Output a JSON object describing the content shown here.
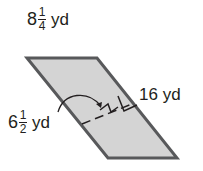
{
  "figure": {
    "shape": "parallelogram",
    "fill_color": "#d4d4d4",
    "stroke_color": "#58595b",
    "vertices": [
      [
        27,
        58
      ],
      [
        97,
        58
      ],
      [
        177,
        158
      ],
      [
        108,
        158
      ]
    ]
  },
  "labels": {
    "base": {
      "whole": "8",
      "num": "1",
      "den": "4",
      "unit": "yd"
    },
    "side": {
      "text": "16 yd"
    },
    "height": {
      "whole": "6",
      "num": "1",
      "den": "2",
      "unit": "yd"
    }
  }
}
